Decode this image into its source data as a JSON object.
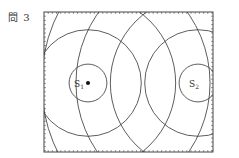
{
  "figure": {
    "label": "問 3",
    "sources": [
      {
        "id": "S1",
        "name": "S",
        "subscript": "1",
        "marked": true
      },
      {
        "id": "S2",
        "name": "S",
        "subscript": "2",
        "marked": false
      }
    ],
    "wavefront_count_per_source": 7,
    "wavelength_units": 1,
    "source_separation_wavelengths": 3.2,
    "colors": {
      "line": "#333333",
      "frame": "#444444",
      "background": "#ffffff"
    }
  }
}
